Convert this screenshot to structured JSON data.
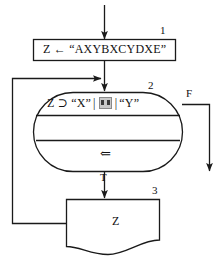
{
  "diagram": {
    "type": "flowchart",
    "stroke_color": "#1a1a1a",
    "background_color": "#ffffff",
    "steps": [
      {
        "number": "1",
        "shape": "process-box",
        "text": "Z ← “AXYBXCYDXE”"
      },
      {
        "number": "2",
        "shape": "stadium-decision",
        "condition_parts": {
          "operand_left": "Z ⊃ “X”",
          "separator_1": "|",
          "unknown_glyph": "▨",
          "separator_2": "|",
          "operand_right": "“Y”"
        },
        "body_arrow": "⇐"
      },
      {
        "number": "3",
        "shape": "document",
        "text": "Z"
      }
    ],
    "branches": [
      {
        "name": "true-branch",
        "label": "T",
        "from": "2",
        "to": "3"
      },
      {
        "name": "false-branch",
        "label": "F",
        "from": "2",
        "to": "exit"
      }
    ],
    "connectors": [
      {
        "name": "entry-arrow",
        "from": "start",
        "to": "1"
      },
      {
        "name": "assign-to-cond",
        "from": "1",
        "to": "2"
      },
      {
        "name": "feedback-loop",
        "from": "3",
        "to": "2"
      }
    ]
  }
}
